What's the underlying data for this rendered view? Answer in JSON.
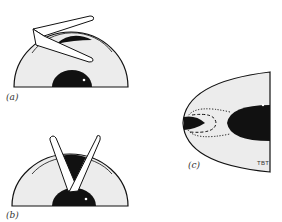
{
  "figure": {
    "panels": [
      {
        "id": "a",
        "label": "(a)",
        "description": "half-disk with folded strip laid across top"
      },
      {
        "id": "b",
        "label": "(b)",
        "description": "half-disk with two strips forming a V"
      },
      {
        "id": "c",
        "label": "(c)",
        "description": "parabolic region with dotted and dashed curves"
      }
    ],
    "signature": "TBT",
    "colors": {
      "fill": "#ececec",
      "ink": "#111111",
      "background": "#ffffff"
    }
  }
}
